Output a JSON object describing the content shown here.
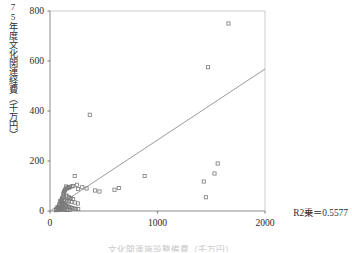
{
  "figure": {
    "y_axis_label": "75年度文化関連経費（千万円）",
    "x_axis_caption": "文化関連施設整備費（千万円）",
    "annotation": "R2乗＝0.5577"
  },
  "colors": {
    "axis": "#808080",
    "marker": "#7a7a7a",
    "trendline": "#8f8f8f",
    "text": "#2e2e2e"
  },
  "chart_data": {
    "type": "scatter",
    "title": "",
    "xlabel": "文化関連施設整備費（千万円）",
    "ylabel": "75年度文化関連経費（千万円）",
    "xlim": [
      0,
      2000
    ],
    "ylim": [
      0,
      800
    ],
    "xticks": [
      0,
      1000,
      2000
    ],
    "yticks": [
      0,
      200,
      400,
      600,
      800
    ],
    "xtick_labels": [
      "0",
      "1000",
      "2000"
    ],
    "ytick_labels": [
      "0",
      "200",
      "400",
      "600",
      "800"
    ],
    "grid": false,
    "legend": null,
    "annotations": [
      {
        "text": "R2乗＝0.5577",
        "r_squared": 0.5577
      }
    ],
    "series": [
      {
        "name": "都道府県",
        "marker": "open-square",
        "points": [
          [
            1660,
            750
          ],
          [
            1470,
            575
          ],
          [
            370,
            385
          ],
          [
            1560,
            190
          ],
          [
            1530,
            150
          ],
          [
            1430,
            118
          ],
          [
            1450,
            55
          ],
          [
            230,
            140
          ],
          [
            880,
            140
          ],
          [
            640,
            92
          ],
          [
            600,
            85
          ],
          [
            460,
            78
          ],
          [
            420,
            82
          ],
          [
            340,
            90
          ],
          [
            300,
            95
          ],
          [
            260,
            88
          ],
          [
            250,
            105
          ],
          [
            215,
            100
          ],
          [
            200,
            98
          ],
          [
            185,
            96
          ],
          [
            175,
            92
          ],
          [
            165,
            95
          ],
          [
            158,
            90
          ],
          [
            150,
            98
          ],
          [
            145,
            88
          ],
          [
            140,
            84
          ],
          [
            135,
            80
          ],
          [
            130,
            76
          ],
          [
            128,
            72
          ],
          [
            125,
            68
          ],
          [
            150,
            62
          ],
          [
            160,
            58
          ],
          [
            175,
            55
          ],
          [
            195,
            52
          ],
          [
            215,
            48
          ],
          [
            120,
            58
          ],
          [
            115,
            52
          ],
          [
            110,
            48
          ],
          [
            108,
            44
          ],
          [
            130,
            44
          ],
          [
            145,
            42
          ],
          [
            160,
            40
          ],
          [
            175,
            38
          ],
          [
            200,
            36
          ],
          [
            230,
            34
          ],
          [
            260,
            30
          ],
          [
            95,
            40
          ],
          [
            100,
            36
          ],
          [
            105,
            32
          ],
          [
            112,
            30
          ],
          [
            120,
            28
          ],
          [
            128,
            26
          ],
          [
            136,
            24
          ],
          [
            145,
            22
          ],
          [
            155,
            20
          ],
          [
            165,
            18
          ],
          [
            178,
            16
          ],
          [
            190,
            14
          ],
          [
            205,
            12
          ],
          [
            220,
            10
          ],
          [
            240,
            9
          ],
          [
            262,
            8
          ],
          [
            85,
            26
          ],
          [
            88,
            22
          ],
          [
            92,
            18
          ],
          [
            96,
            14
          ],
          [
            100,
            12
          ],
          [
            105,
            10
          ],
          [
            112,
            8
          ],
          [
            120,
            7
          ],
          [
            130,
            6
          ],
          [
            142,
            5
          ],
          [
            155,
            5
          ],
          [
            170,
            4
          ],
          [
            185,
            4
          ],
          [
            70,
            16
          ],
          [
            74,
            12
          ],
          [
            78,
            9
          ],
          [
            82,
            7
          ],
          [
            88,
            5
          ],
          [
            95,
            4
          ],
          [
            60,
            8
          ],
          [
            64,
            5
          ],
          [
            55,
            3
          ]
        ]
      }
    ],
    "trendline": {
      "type": "linear",
      "x_from": 0,
      "x_to": 2000,
      "y_from": 0,
      "y_to": 568
    }
  }
}
